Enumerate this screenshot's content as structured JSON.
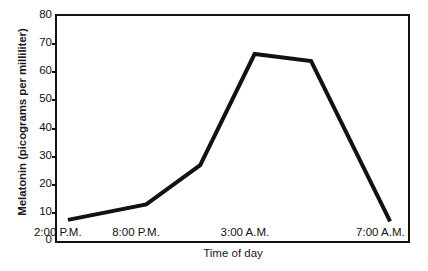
{
  "chart_data": {
    "type": "line",
    "title": "",
    "xlabel": "Time of day",
    "ylabel": "Melatonin (picograms per milliliter)",
    "categories": [
      "2:00 P.M.",
      "8:00 P.M.",
      "3:00 A.M.",
      "7:00 A.M."
    ],
    "x_tick_labels": [
      "2:00 P.M.",
      "8:00 P.M.",
      "3:00 A.M.",
      "7:00 A.M."
    ],
    "y_tick_labels": [
      "0",
      "10",
      "20",
      "30",
      "40",
      "50",
      "60",
      "70",
      "80"
    ],
    "y_tick_values": [
      0,
      10,
      20,
      30,
      40,
      50,
      60,
      70,
      80
    ],
    "ylim": [
      0,
      80
    ],
    "xlim": [
      0,
      100
    ],
    "grid": false,
    "legend": false,
    "legend_position": "none",
    "line_color": "#121212",
    "line_width": 4,
    "series": [
      {
        "name": "Melatonin",
        "points": [
          {
            "x": 3.1,
            "y": 7.5,
            "label": "2:00 P.M."
          },
          {
            "x": 25.4,
            "y": 13.0,
            "label": "8:00 P.M."
          },
          {
            "x": 40.8,
            "y": 27.0,
            "label": ""
          },
          {
            "x": 56.3,
            "y": 66.5,
            "label": "3:00 A.M."
          },
          {
            "x": 72.4,
            "y": 64.0,
            "label": ""
          },
          {
            "x": 94.9,
            "y": 7.0,
            "label": "7:00 A.M."
          }
        ]
      }
    ]
  },
  "axis": {
    "x_title": "Time of day",
    "y_title": "Melatonin (picograms per milliliter)"
  }
}
